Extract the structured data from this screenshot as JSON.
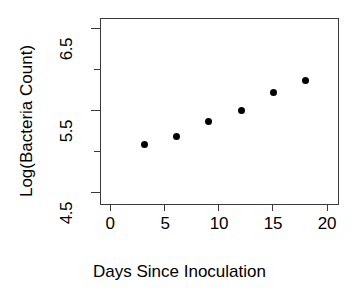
{
  "chart_data": {
    "type": "scatter",
    "title": "",
    "xlabel": "Days Since Inoculation",
    "ylabel": "Log(Bacteria Count)",
    "x": [
      3,
      6,
      9,
      12,
      15,
      18
    ],
    "values": [
      5.1,
      5.2,
      5.4,
      5.55,
      5.8,
      5.95
    ],
    "series": [
      {
        "name": "Log(Bacteria Count)",
        "points": [
          {
            "x": 3,
            "y": 5.1
          },
          {
            "x": 6,
            "y": 5.2
          },
          {
            "x": 9,
            "y": 5.4
          },
          {
            "x": 12,
            "y": 5.55
          },
          {
            "x": 15,
            "y": 5.8
          },
          {
            "x": 18,
            "y": 5.95
          }
        ]
      }
    ],
    "xlim": [
      -1.0,
      21.0
    ],
    "ylim": [
      4.3,
      6.78
    ],
    "xticks": [
      0,
      5,
      10,
      15,
      20
    ],
    "xtick_labels": [
      "0",
      "5",
      "10",
      "15",
      "20"
    ],
    "yticks": [
      4.5,
      5.0,
      5.5,
      6.0,
      6.5
    ],
    "ytick_labels": [
      "4.5",
      "",
      "5.5",
      "",
      "6.5"
    ],
    "ytick_major": [
      4.5,
      5.5,
      6.5
    ],
    "grid": false,
    "legend": false,
    "marker": "filled-circle",
    "marker_color": "#000000",
    "frame_color": "#3a3a3a",
    "background": "#ffffff"
  }
}
